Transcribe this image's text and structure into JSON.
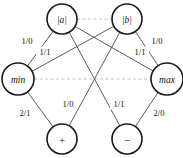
{
  "diagram": {
    "colors": {
      "node_stroke": "#1a1a1a",
      "node_fill": "#ffffff",
      "edge": "#4a4a4a",
      "sibling_dashed": "#b9b9b9",
      "text": "#111111"
    },
    "nodes": [
      {
        "id": "abs_a",
        "label": "|a|",
        "x": 62,
        "y": 19,
        "r": 15,
        "style": "italic"
      },
      {
        "id": "abs_b",
        "label": "|b|",
        "x": 127,
        "y": 19,
        "r": 15,
        "style": "italic"
      },
      {
        "id": "min",
        "label": "min",
        "x": 18,
        "y": 79,
        "r": 16,
        "style": "italic"
      },
      {
        "id": "max",
        "label": "max",
        "x": 167,
        "y": 79,
        "r": 16,
        "style": "italic"
      },
      {
        "id": "plus",
        "label": "+",
        "x": 62,
        "y": 139,
        "r": 15,
        "style": "operator"
      },
      {
        "id": "minus",
        "label": "−",
        "x": 127,
        "y": 139,
        "r": 15,
        "style": "operator"
      }
    ],
    "sibling_links": [
      {
        "from": "abs_a",
        "to": "abs_b"
      },
      {
        "from": "min",
        "to": "max"
      }
    ],
    "edges": [
      {
        "from": "abs_a",
        "to": "min",
        "label": "1/0",
        "label_x": 27,
        "label_y": 41
      },
      {
        "from": "abs_b",
        "to": "min",
        "label": "1/1",
        "label_x": 45,
        "label_y": 52
      },
      {
        "from": "abs_a",
        "to": "max",
        "label": "1/1",
        "label_x": 140,
        "label_y": 52
      },
      {
        "from": "abs_b",
        "to": "max",
        "label": "1/0",
        "label_x": 157,
        "label_y": 41
      },
      {
        "from": "min",
        "to": "plus",
        "label": "2/1",
        "label_x": 25,
        "label_y": 113
      },
      {
        "from": "abs_b",
        "to": "plus",
        "label": "1/0",
        "label_x": 68,
        "label_y": 104
      },
      {
        "from": "abs_a",
        "to": "minus",
        "label": "1/1",
        "label_x": 119,
        "label_y": 104
      },
      {
        "from": "max",
        "to": "minus",
        "label": "2/0",
        "label_x": 159,
        "label_y": 113
      }
    ]
  }
}
